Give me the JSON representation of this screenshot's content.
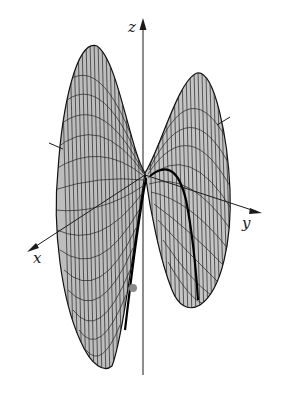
{
  "figure": {
    "background": "#ffffff",
    "surface_fill": "#bdbdbd",
    "surface_fill_light": "#d6d6d6",
    "mesh_color": "#222222",
    "axis_color": "#1a1a1a",
    "highlight_curve_color": "#000000",
    "axes": {
      "x": {
        "label": "x"
      },
      "y": {
        "label": "y"
      },
      "z": {
        "label": "z"
      }
    },
    "saddle_point": {
      "x": 145,
      "y": 173
    },
    "highlight_point": {
      "label": "",
      "color": "#8a8a8a"
    }
  }
}
